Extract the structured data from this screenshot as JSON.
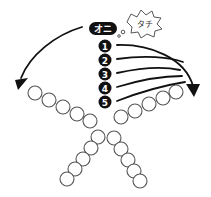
{
  "diagram": {
    "oni_label": "オニ",
    "speech_bubble_text": "タチ",
    "players": [
      {
        "label": "1",
        "x": 105,
        "y": 46
      },
      {
        "label": "2",
        "x": 105,
        "y": 60
      },
      {
        "label": "3",
        "x": 105,
        "y": 74
      },
      {
        "label": "4",
        "x": 105,
        "y": 88
      },
      {
        "label": "5",
        "x": 105,
        "y": 102
      }
    ],
    "colors": {
      "badge_fill": "#111111",
      "badge_text": "#ffffff",
      "ring_stroke": "#555555",
      "arrow": "#111111",
      "background": "#ffffff"
    },
    "chains": {
      "upper_left": [
        [
          35,
          93
        ],
        [
          49,
          100
        ],
        [
          63,
          107
        ],
        [
          77,
          114
        ],
        [
          90,
          121
        ]
      ],
      "upper_right": [
        [
          121,
          117
        ],
        [
          135,
          111
        ],
        [
          149,
          104
        ],
        [
          163,
          98
        ],
        [
          176,
          92
        ]
      ],
      "lower_left": [
        [
          98,
          137
        ],
        [
          91,
          148
        ],
        [
          83,
          159
        ],
        [
          75,
          169
        ],
        [
          67,
          179
        ]
      ],
      "lower_right": [
        [
          114,
          138
        ],
        [
          121,
          149
        ],
        [
          128,
          160
        ],
        [
          134,
          171
        ],
        [
          140,
          181
        ]
      ]
    }
  }
}
